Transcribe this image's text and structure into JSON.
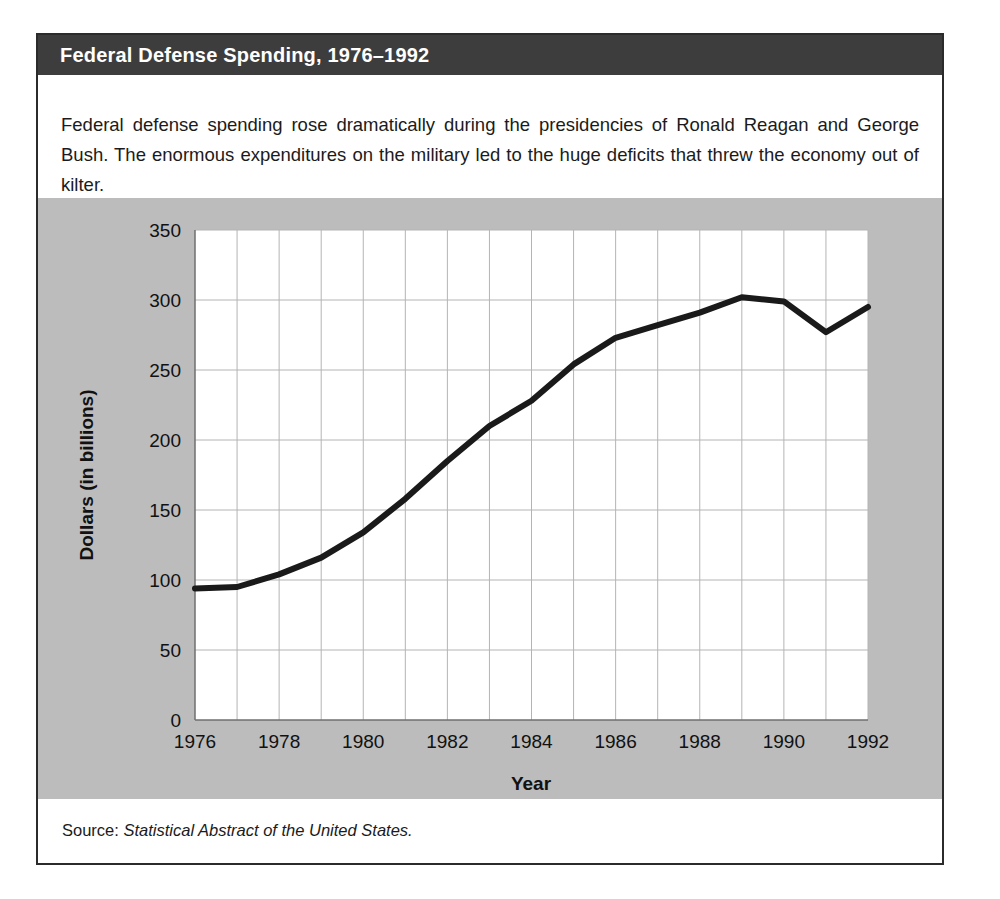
{
  "figure": {
    "title": "Federal Defense Spending, 1976–1992",
    "caption": "Federal defense spending rose dramatically during the presidencies of Ronald Reagan and George Bush. The enormous expenditures on the military led to the huge deficits that threw the economy out of kilter.",
    "source_label": "Source:",
    "source_title": "Statistical Abstract of the United States.",
    "colors": {
      "title_bar": "#3d3d3d",
      "title_text": "#ffffff",
      "panel_background": "#bcbcbc",
      "plot_background": "#ffffff",
      "border": "#2b2b2b",
      "line": "#1a1a1a",
      "gridline": "#b0b0b0"
    }
  },
  "chart_data": {
    "type": "line",
    "title": "Federal Defense Spending, 1976–1992",
    "xlabel": "Year",
    "ylabel": "Dollars (in billions)",
    "xlim": [
      1976,
      1992
    ],
    "ylim": [
      0,
      350
    ],
    "yticks": [
      0,
      50,
      100,
      150,
      200,
      250,
      300,
      350
    ],
    "ytick_labels": [
      "0",
      "50",
      "100",
      "150",
      "200",
      "250",
      "300",
      "350"
    ],
    "xticks": [
      1976,
      1978,
      1980,
      1982,
      1984,
      1986,
      1988,
      1990,
      1992
    ],
    "xtick_labels": [
      "1976",
      "1978",
      "1980",
      "1982",
      "1984",
      "1986",
      "1988",
      "1990",
      "1992"
    ],
    "x_gridline_step": 1,
    "grid": true,
    "legend": false,
    "series": [
      {
        "name": "Federal defense spending",
        "x": [
          1976,
          1977,
          1978,
          1979,
          1980,
          1981,
          1982,
          1983,
          1984,
          1985,
          1986,
          1987,
          1988,
          1989,
          1990,
          1991,
          1992
        ],
        "values": [
          94,
          95,
          104,
          116,
          134,
          158,
          185,
          210,
          228,
          254,
          273,
          282,
          291,
          302,
          299,
          277,
          295
        ]
      }
    ]
  }
}
